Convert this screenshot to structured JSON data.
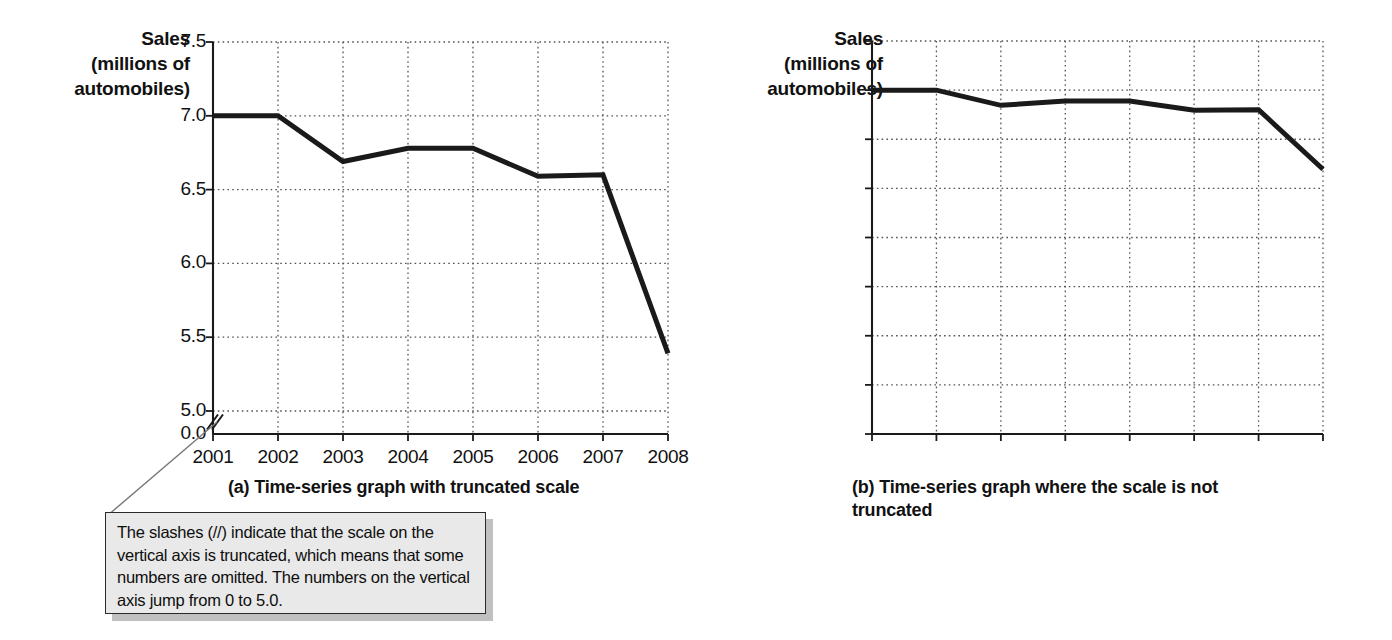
{
  "figure": {
    "background": "#ffffff",
    "line_color": "#1a1a1a",
    "axis_color": "#1a1a1a",
    "grid_color": "#555555",
    "callout_fill": "#e9e9e9",
    "callout_border": "#2a2a2a"
  },
  "panel_a": {
    "axis_title": "Sales\n(millions of\nautomobiles)",
    "axis_title_line1": "Sales",
    "axis_title_line2": "(millions of",
    "axis_title_line3": "automobiles)",
    "caption": "(a) Time-series graph with truncated scale",
    "truncation_marker": "//",
    "truncated": true
  },
  "panel_b": {
    "axis_title_line1": "Sales",
    "axis_title_line2": "(millions of",
    "axis_title_line3": "automobiles)",
    "caption": "(b) Time-series graph where the scale is not truncated",
    "truncated": false
  },
  "callout": {
    "text": "The slashes (//) indicate that the scale on the vertical axis is truncated, which means that some numbers are omitted.  The numbers on the vertical axis jump from 0 to 5.0."
  },
  "chart_data": [
    {
      "id": "panel-a",
      "type": "line",
      "title": "(a) Time-series graph with truncated scale",
      "xlabel": "",
      "ylabel": "Sales (millions of automobiles)",
      "categories": [
        "2001",
        "2002",
        "2003",
        "2004",
        "2005",
        "2006",
        "2007",
        "2008"
      ],
      "x": [
        2001,
        2002,
        2003,
        2004,
        2005,
        2006,
        2007,
        2008
      ],
      "values": [
        7.0,
        7.0,
        6.69,
        6.78,
        6.78,
        6.59,
        6.6,
        5.39
      ],
      "ylim": [
        5.0,
        7.5
      ],
      "yticks": [
        "0.0",
        "5.0",
        "5.5",
        "6.0",
        "6.5",
        "7.0",
        "7.5"
      ],
      "ytick_values": [
        0.0,
        5.0,
        5.5,
        6.0,
        6.5,
        7.0,
        7.5
      ],
      "xticks": [
        "2001",
        "2002",
        "2003",
        "2004",
        "2005",
        "2006",
        "2007",
        "2008"
      ],
      "grid": true,
      "legend": "none",
      "truncated_axis": true,
      "annotation": "The slashes (//) indicate that the scale on the vertical axis is truncated, which means that some numbers are omitted.  The numbers on the vertical axis jump from 0 to 5.0."
    },
    {
      "id": "panel-b",
      "type": "line",
      "title": "(b) Time-series graph where the scale is not truncated",
      "xlabel": "",
      "ylabel": "Sales (millions of automobiles)",
      "categories": [
        "2001",
        "2002",
        "2003",
        "2004",
        "2005",
        "2006",
        "2007",
        "2008"
      ],
      "x": [
        2001,
        2002,
        2003,
        2004,
        2005,
        2006,
        2007,
        2008
      ],
      "values": [
        7.0,
        7.0,
        6.69,
        6.78,
        6.78,
        6.59,
        6.6,
        5.39
      ],
      "ylim": [
        0.0,
        8.0
      ],
      "yticks": [
        "0.0",
        "1.0",
        "2.0",
        "3.0",
        "4.0",
        "5.0",
        "6.0",
        "7.0",
        "8.0"
      ],
      "ytick_values": [
        0.0,
        1.0,
        2.0,
        3.0,
        4.0,
        5.0,
        6.0,
        7.0,
        8.0
      ],
      "xticks": [
        "2001",
        "2002",
        "2003",
        "2004",
        "2005",
        "2006",
        "2007",
        "2008"
      ],
      "grid": true,
      "legend": "none",
      "truncated_axis": false
    }
  ]
}
